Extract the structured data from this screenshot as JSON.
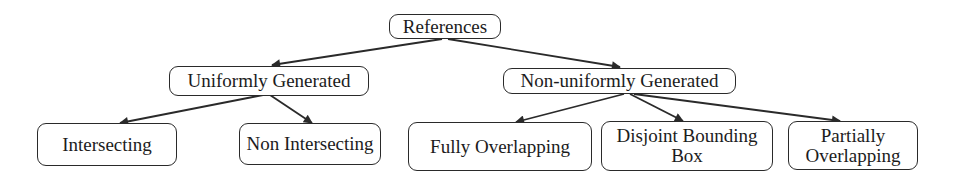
{
  "diagram": {
    "type": "tree",
    "root": {
      "label": "References"
    },
    "level1": [
      {
        "label": "Uniformly Generated"
      },
      {
        "label": "Non-uniformly Generated"
      }
    ],
    "level2": [
      {
        "label": "Intersecting",
        "parent": "Uniformly Generated"
      },
      {
        "label": "Non Intersecting",
        "parent": "Uniformly Generated"
      },
      {
        "label": "Fully Overlapping",
        "parent": "Non-uniformly Generated"
      },
      {
        "label": "Disjoint Bounding Box",
        "line1": "Disjoint Bounding",
        "line2": "Box",
        "parent": "Non-uniformly Generated"
      },
      {
        "label": "Partially Overlapping",
        "line1": "Partially",
        "line2": "Overlapping",
        "parent": "Non-uniformly Generated"
      }
    ],
    "edges": [
      {
        "from": "References",
        "to": "Uniformly Generated"
      },
      {
        "from": "References",
        "to": "Non-uniformly Generated"
      },
      {
        "from": "Uniformly Generated",
        "to": "Intersecting"
      },
      {
        "from": "Uniformly Generated",
        "to": "Non Intersecting"
      },
      {
        "from": "Non-uniformly Generated",
        "to": "Fully Overlapping"
      },
      {
        "from": "Non-uniformly Generated",
        "to": "Disjoint Bounding Box"
      },
      {
        "from": "Non-uniformly Generated",
        "to": "Partially Overlapping"
      }
    ],
    "colors": {
      "stroke": "#2a2a2a",
      "text": "#1c1c1c",
      "background": "#ffffff"
    }
  }
}
